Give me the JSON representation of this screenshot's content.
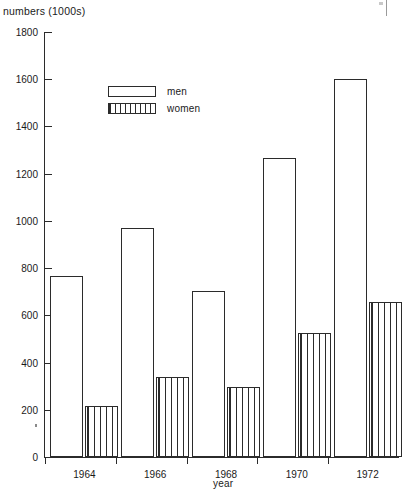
{
  "chart_data": {
    "type": "bar",
    "title": "",
    "ylabel": "numbers (1000s)",
    "xlabel": "year",
    "categories": [
      "1964",
      "1966",
      "1968",
      "1970",
      "1972"
    ],
    "series": [
      {
        "name": "men",
        "values": [
          765,
          970,
          705,
          1265,
          1600
        ]
      },
      {
        "name": "women",
        "values": [
          215,
          340,
          295,
          525,
          655
        ]
      }
    ],
    "ylim": [
      0,
      1800
    ],
    "ytick_step": 200,
    "yticks": [
      0,
      200,
      400,
      600,
      800,
      1000,
      1200,
      1400,
      1600,
      1800
    ],
    "ytick_labels": [
      "0",
      "200",
      "400",
      "600",
      "800",
      "1000",
      "1200",
      "1400",
      "1600",
      "1800"
    ],
    "grid": false,
    "legend_position": "top-left",
    "legend": [
      {
        "label": "men",
        "fill": "none"
      },
      {
        "label": "women",
        "fill": "vertical-hatch"
      }
    ],
    "line_color": "#2b2b2b",
    "bar_face_color": "#ffffff"
  }
}
